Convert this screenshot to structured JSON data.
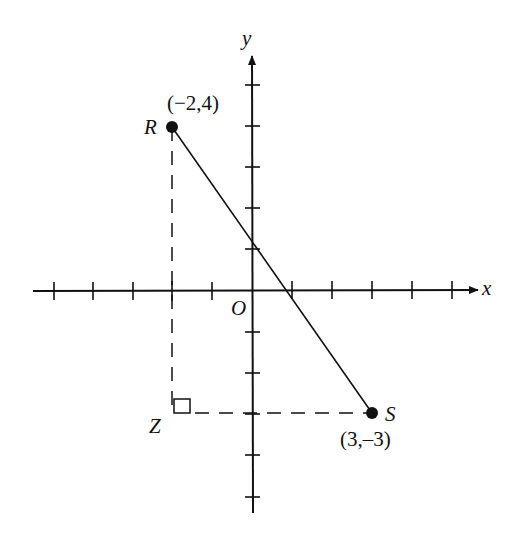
{
  "diagram": {
    "type": "coordinate-plane",
    "axes": {
      "x_label": "x",
      "y_label": "y",
      "origin_label": "O",
      "x_range": [
        -5,
        5
      ],
      "y_range": [
        -5,
        5
      ]
    },
    "points": [
      {
        "name": "R",
        "coords_label": "(−2,4)",
        "x": -2,
        "y": 4
      },
      {
        "name": "S",
        "coords_label": "(3,–3)",
        "x": 3,
        "y": -3
      },
      {
        "name": "Z",
        "x": -2,
        "y": -3
      }
    ],
    "segments": [
      {
        "from": "R",
        "to": "S",
        "style": "solid"
      },
      {
        "from": "R",
        "to": "Z",
        "style": "dashed"
      },
      {
        "from": "Z",
        "to": "S",
        "style": "dashed"
      }
    ],
    "right_angle_at": "Z",
    "colors": {
      "ink": "#111111",
      "background": "#ffffff"
    }
  }
}
